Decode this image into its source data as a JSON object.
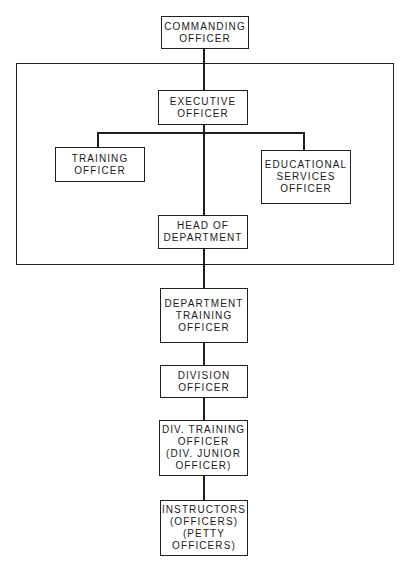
{
  "diagram": {
    "type": "organizational-chart",
    "nodes": {
      "commanding_officer": {
        "line1": "COMMANDING",
        "line2": "OFFICER"
      },
      "executive_officer": {
        "line1": "EXECUTIVE",
        "line2": "OFFICER"
      },
      "training_officer": {
        "line1": "TRAINING",
        "line2": "OFFICER"
      },
      "educational_services_officer": {
        "line1": "EDUCATIONAL",
        "line2": "SERVICES",
        "line3": "OFFICER"
      },
      "head_of_department": {
        "line1": "HEAD OF",
        "line2": "DEPARTMENT"
      },
      "department_training_officer": {
        "line1": "DEPARTMENT",
        "line2": "TRAINING",
        "line3": "OFFICER"
      },
      "division_officer": {
        "line1": "DIVISION",
        "line2": "OFFICER"
      },
      "div_training_officer": {
        "line1": "DIV. TRAINING",
        "line2": "OFFICER",
        "line3": "(DIV. JUNIOR",
        "line4": "OFFICER)"
      },
      "instructors": {
        "line1": "INSTRUCTORS",
        "line2": "(OFFICERS)",
        "line3": "(PETTY",
        "line4": "OFFICERS)"
      }
    },
    "edges": [
      [
        "commanding_officer",
        "executive_officer"
      ],
      [
        "executive_officer",
        "training_officer"
      ],
      [
        "executive_officer",
        "educational_services_officer"
      ],
      [
        "executive_officer",
        "head_of_department"
      ],
      [
        "head_of_department",
        "department_training_officer"
      ],
      [
        "department_training_officer",
        "division_officer"
      ],
      [
        "division_officer",
        "div_training_officer"
      ],
      [
        "div_training_officer",
        "instructors"
      ]
    ],
    "group_frame": {
      "contains": [
        "executive_officer",
        "training_officer",
        "educational_services_officer",
        "head_of_department"
      ]
    },
    "colors": {
      "line": "#1f1f1f",
      "background": "#ffffff",
      "text": "#1a1a1a"
    }
  }
}
